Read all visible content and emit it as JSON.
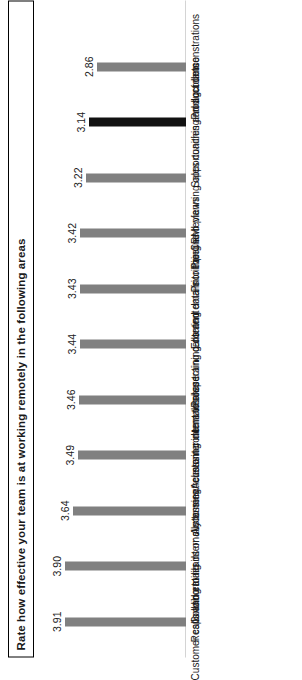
{
  "chart_data": {
    "type": "bar",
    "title": "Rate how effective your team is at working remotely in the following areas",
    "subtitle": "",
    "xlabel": "",
    "ylabel": "",
    "ylim": [
      0,
      4.2
    ],
    "grid": false,
    "legend": null,
    "orientation": "vertical-bars-rotated-90ccw",
    "bar_color": "#808080",
    "highlight_color": "#121212",
    "categories": [
      "Customer calls and emails",
      "Responding to leads or customers",
      "Collaborating internally to meet customer demands",
      "Accessing relevant content to share",
      "Accessing internal sales training content",
      "Prospecting calls and emails",
      "Entering data into the CRM",
      "Pipeline reviews",
      "Prioritizing and planning opportunities and accounts",
      "Sales coaching and guidance",
      "Product demonstrations"
    ],
    "values": [
      3.91,
      3.9,
      3.64,
      3.49,
      3.46,
      3.44,
      3.43,
      3.42,
      3.22,
      3.14,
      2.86
    ],
    "value_labels": [
      "3.91",
      "3.90",
      "3.64",
      "3.49",
      "3.46",
      "3.44",
      "3.43",
      "3.42",
      "3.22",
      "3.14",
      "2.86"
    ],
    "highlighted_indices": [
      9
    ]
  }
}
